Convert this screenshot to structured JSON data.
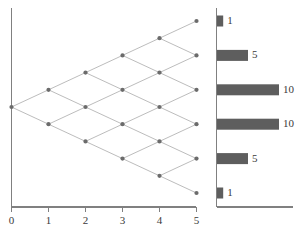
{
  "figure": {
    "caption": "",
    "colors": {
      "axis": "#808080",
      "edge": "#b4b4b4",
      "node": "#6b6b6b",
      "bar": "#5e5e5e",
      "text": "#3a3a3a",
      "background": "#ffffff"
    }
  },
  "lattice": {
    "title": "",
    "xaxis": {
      "label": "",
      "ticks": [
        "0",
        "1",
        "2",
        "3",
        "4",
        "5"
      ],
      "min": 0,
      "max": 5
    },
    "yaxis": {
      "label": "",
      "ticks": []
    },
    "steps": 6,
    "node_counts": [
      1,
      2,
      3,
      4,
      5,
      6
    ],
    "description": "binomial lattice / recombining tree with 6 time steps"
  },
  "chart_data": {
    "type": "bar",
    "orientation": "horizontal",
    "title": "",
    "xlabel": "",
    "ylabel": "",
    "categories": [
      "5",
      "4",
      "3",
      "2",
      "1",
      "0"
    ],
    "values": [
      1,
      5,
      10,
      10,
      5,
      1
    ],
    "labels": [
      "1",
      "5",
      "10",
      "10",
      "5",
      "1"
    ],
    "xlim": [
      0,
      10
    ],
    "grid": false,
    "legend": null
  }
}
